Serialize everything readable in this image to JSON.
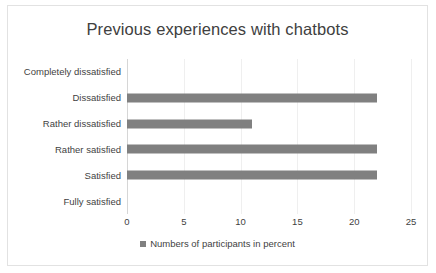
{
  "chart_data": {
    "type": "bar",
    "orientation": "horizontal",
    "title": "Previous experiences with chatbots",
    "xlabel": "",
    "ylabel": "",
    "categories": [
      "Completely dissatisfied",
      "Dissatisfied",
      "Rather dissatisfied",
      "Rather satisfied",
      "Satisfied",
      "Fully satisfied"
    ],
    "values": [
      0,
      22,
      11,
      22,
      22,
      0
    ],
    "series": [
      {
        "name": "Numbers of participants in percent",
        "values": [
          0,
          22,
          11,
          22,
          22,
          0
        ]
      }
    ],
    "xlim": [
      0,
      25
    ],
    "xticks": [
      0,
      5,
      10,
      15,
      20,
      25
    ],
    "xtick_labels": [
      "0",
      "5",
      "10",
      "15",
      "20",
      "25"
    ],
    "grid": "vertical",
    "legend": {
      "position": "bottom",
      "entries": [
        "Numbers of participants in percent"
      ]
    },
    "colors": {
      "bar": "#808080",
      "gridline": "#efefef",
      "axis": "#d6d6d6",
      "text": "#3f3f3f",
      "title": "#404040",
      "border": "#e2e2e2",
      "background": "#ffffff"
    }
  }
}
